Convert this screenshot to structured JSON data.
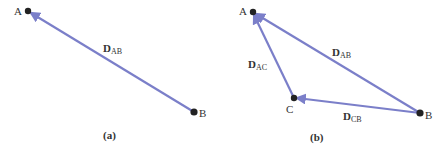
{
  "colors": {
    "vector": "#7b7fc9",
    "point": "#222222",
    "text": "#333333",
    "background": "#ffffff"
  },
  "panels": [
    {
      "id": "a",
      "caption": "(a)",
      "points": [
        {
          "name": "A",
          "x": 28,
          "y": 11
        },
        {
          "name": "B",
          "x": 194,
          "y": 112
        }
      ],
      "vectors": [
        {
          "label_main": "D",
          "label_sub": "AB",
          "from": "B",
          "to": "A"
        }
      ]
    },
    {
      "id": "b",
      "caption": "(b)",
      "points": [
        {
          "name": "A",
          "x": 253,
          "y": 12
        },
        {
          "name": "C",
          "x": 294,
          "y": 98
        },
        {
          "name": "B",
          "x": 420,
          "y": 113
        }
      ],
      "vectors": [
        {
          "label_main": "D",
          "label_sub": "AB",
          "from": "B",
          "to": "A"
        },
        {
          "label_main": "D",
          "label_sub": "AC",
          "from": "C",
          "to": "A"
        },
        {
          "label_main": "D",
          "label_sub": "CB",
          "from": "B",
          "to": "C"
        }
      ]
    }
  ]
}
